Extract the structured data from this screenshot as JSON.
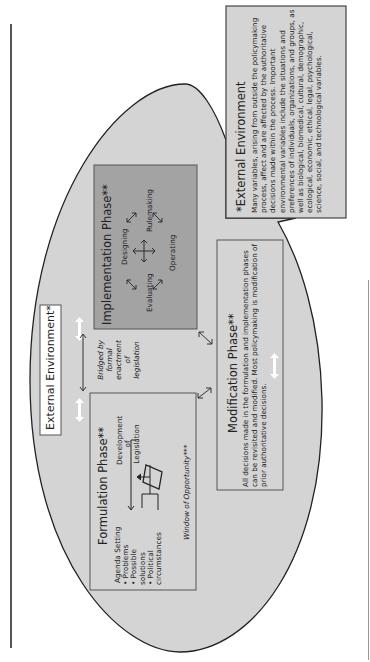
{
  "diagram": {
    "title_label": "External Environment*",
    "colors": {
      "ellipse_fill": "#d4d4d4",
      "implementation_fill": "#a3a3a3",
      "box_border": "#555555",
      "external_box_fill": "#d4d4d4",
      "arrow_white": "#ffffff"
    },
    "formulation": {
      "title": "Formulation Phase**",
      "agenda_setting": "Agenda Setting",
      "bullets": [
        "Problems",
        "Possible solutions",
        "Political circumstances"
      ],
      "development": [
        "Development",
        "of",
        "Legislation"
      ],
      "window": "Window of Opportunity***"
    },
    "bridge": {
      "lines": [
        "Bridged by",
        "formal",
        "enactment",
        "of",
        "legislation"
      ]
    },
    "implementation": {
      "title": "Implementation Phase**",
      "activities": [
        "Designing",
        "Rulemaking",
        "Operating",
        "Evaluating"
      ]
    },
    "modification": {
      "title": "Modification Phase**",
      "body": "All decisions made in the formulation and implementation phases can be revisited and modified. Most policymaking is modification of prior authoritative decisions."
    },
    "external_note": {
      "title": "*External Environment",
      "body": "Many variables, arising from outside the policymaking process, affect and are affected by the authoritative decisions made within the process. Important environmental variables include the situations and preferences of individuals, organizations, and groups, as well as biological, biomedical, cultural, demographic, ecological, economic, ethical, legal, psychological, science, social, and technological variables."
    }
  }
}
